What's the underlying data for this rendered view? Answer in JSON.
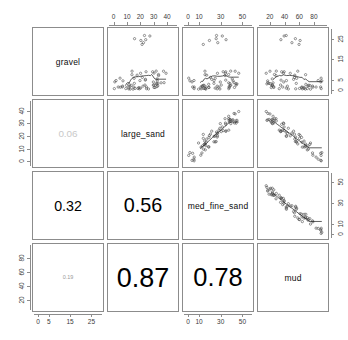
{
  "chart_data": {
    "type": "scatter",
    "subtype": "scatterplot-matrix",
    "title": "",
    "variables": [
      "gravel",
      "large_sand",
      "med_fine_sand",
      "mud"
    ],
    "grid": false,
    "legend": "none",
    "upper_panel": "scatter with lowess smoother",
    "lower_panel": "correlation coefficient sized by magnitude",
    "diagonal_panel": "variable name",
    "axes": {
      "gravel": {
        "label": "gravel",
        "ticks": [
          0,
          5,
          15,
          25
        ],
        "range": [
          -1,
          29
        ]
      },
      "large_sand": {
        "label": "large_sand",
        "ticks": [
          0,
          10,
          20,
          30,
          40
        ],
        "range": [
          -2,
          46
        ]
      },
      "med_fine_sand": {
        "label": "med_fine_sand",
        "ticks": [
          0,
          10,
          30,
          50
        ],
        "range": [
          -2,
          57
        ]
      },
      "mud": {
        "label": "mud",
        "ticks": [
          20,
          40,
          60,
          80
        ],
        "range": [
          8,
          95
        ]
      }
    },
    "axis_placement": {
      "top_columns": [
        null,
        "large_sand",
        "med_fine_sand",
        "mud"
      ],
      "bottom_columns": [
        "gravel",
        null,
        "med_fine_sand",
        null
      ],
      "left_rows": [
        null,
        "large_sand",
        null,
        "mud"
      ],
      "right_rows": [
        "gravel",
        null,
        "med_fine_sand",
        null
      ]
    },
    "correlations": [
      {
        "row": "large_sand",
        "col": "gravel",
        "value": "0.06",
        "display_scale": 0.18
      },
      {
        "row": "med_fine_sand",
        "col": "gravel",
        "value": "0.32",
        "display_scale": 0.45
      },
      {
        "row": "med_fine_sand",
        "col": "large_sand",
        "value": "0.56",
        "display_scale": 0.8
      },
      {
        "row": "mud",
        "col": "gravel",
        "value": "0.19",
        "display_scale": 0.3
      },
      {
        "row": "mud",
        "col": "large_sand",
        "value": "0.87",
        "display_scale": 1.25
      },
      {
        "row": "mud",
        "col": "med_fine_sand",
        "value": "0.78",
        "display_scale": 1.15
      }
    ],
    "points": {
      "gravel": [
        1.2,
        2.0,
        1.0,
        3.5,
        26.5,
        27.0,
        25.5,
        22.0,
        4.0,
        5.5,
        6.0,
        7.5,
        8.0,
        6.5,
        5.0,
        4.5,
        9.0,
        3.0,
        2.5,
        4.2,
        5.8,
        7.0,
        6.2,
        3.8,
        2.2,
        1.8,
        5.2,
        4.8,
        6.8,
        8.5,
        26.0,
        24.0,
        21.0,
        2.8,
        3.2,
        4.6,
        5.4,
        6.6,
        7.2,
        1.5,
        2.6,
        3.4,
        4.1,
        5.9,
        6.4,
        7.8,
        2.1,
        3.6,
        4.4,
        5.1,
        1.4,
        2.3,
        3.1,
        6.1,
        4.9,
        1.1,
        2.9,
        3.9,
        5.6,
        0.8,
        1.7,
        2.4,
        3.3,
        4.3,
        1.3,
        0.9,
        2.7,
        5.3,
        1.6,
        0.7
      ]
    },
    "n_points": 70
  },
  "figure": {
    "background": "#ffffff",
    "panel_border": "#8c8c8c",
    "point_color": "#4d4d4d",
    "smoother_color": "#1a1a1a",
    "tick_color": "#3a3a3a"
  }
}
